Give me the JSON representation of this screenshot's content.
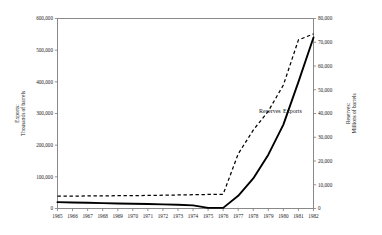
{
  "chart_data": {
    "type": "line",
    "title": "",
    "xlabel": "",
    "x": [
      1965,
      1966,
      1967,
      1968,
      1969,
      1970,
      1971,
      1972,
      1973,
      1974,
      1975,
      1976,
      1977,
      1978,
      1979,
      1980,
      1981,
      1982
    ],
    "xtick_labels": [
      "1965",
      "1966",
      "1967",
      "1968",
      "1969",
      "1970",
      "1971",
      "1972",
      "1973",
      "1974",
      "1975",
      "1976",
      "1977",
      "1978",
      "1979",
      "1980",
      "1981",
      "1982"
    ],
    "xlim": [
      1965,
      1982
    ],
    "grid": false,
    "legend_position": "inline-annotation",
    "axes": [
      {
        "id": "left",
        "title": "Exports:\nThousands of barrels",
        "title_line1": "Exports:",
        "title_line2": "Thousands of barrels",
        "ylim": [
          0,
          600000
        ],
        "ystep": 100000,
        "ytick_labels": [
          "0",
          "100,000",
          "200,000",
          "300,000",
          "400,000",
          "500,000",
          "600,000"
        ],
        "ytick_values": [
          0,
          100000,
          200000,
          300000,
          400000,
          500000,
          600000
        ]
      },
      {
        "id": "right",
        "title": "Reserves:\nMillions of barrels",
        "title_line1": "Reserves:",
        "title_line2": "Millions of barrels",
        "ylim": [
          0,
          80000
        ],
        "ystep": 10000,
        "ytick_labels": [
          "0",
          "10,000",
          "20,000",
          "30,000",
          "40,000",
          "50,000",
          "60,000",
          "70,000",
          "80,000"
        ],
        "ytick_values": [
          0,
          10000,
          20000,
          30000,
          40000,
          50000,
          60000,
          70000,
          80000
        ]
      }
    ],
    "series": [
      {
        "name": "Exports",
        "axis": "left",
        "style": "solid",
        "unit": "Thousands of barrels",
        "values": [
          20000,
          19000,
          18000,
          17000,
          16000,
          15000,
          14000,
          13000,
          12000,
          10000,
          2000,
          2000,
          40000,
          95000,
          170000,
          265000,
          400000,
          540000
        ]
      },
      {
        "name": "Reserves",
        "axis": "right",
        "style": "dashed",
        "unit": "Millions of barrels",
        "values": [
          5200,
          5200,
          5300,
          5300,
          5400,
          5400,
          5500,
          5600,
          5700,
          5800,
          5900,
          6000,
          23000,
          33000,
          41000,
          52000,
          71000,
          73500
        ]
      }
    ],
    "annotations": [
      {
        "text": "Reserves",
        "x": 1979.1,
        "y_px": 113
      },
      {
        "text": "Exports",
        "x": 1980.6,
        "y_px": 113
      }
    ]
  }
}
